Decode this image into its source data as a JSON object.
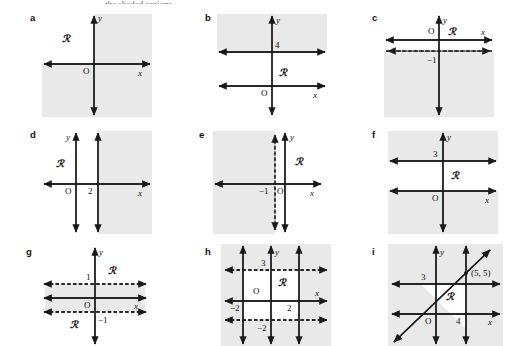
{
  "page": {
    "clipped_header": "the shaded regions.",
    "shade_color": "#e9e9e9",
    "line_color": "#1a1a1a",
    "background": "#ffffff",
    "region_symbol": "ℛ"
  },
  "panels": [
    {
      "key": "a",
      "label": "a",
      "description": "Axes only; unshaded region is the second quadrant.",
      "region_label": "ℛ",
      "axis_labels": {
        "x": "x",
        "y": "y",
        "origin": "O"
      },
      "tick_labels": [],
      "lines": []
    },
    {
      "key": "b",
      "label": "b",
      "description": "Solid horizontal line y = 4; shading above it; region below.",
      "region_label": "ℛ",
      "axis_labels": {
        "x": "x",
        "y": "y",
        "origin": "O"
      },
      "tick_labels": [
        "4"
      ],
      "lines": [
        {
          "type": "horizontal",
          "value": "4",
          "style": "solid"
        }
      ]
    },
    {
      "key": "c",
      "label": "c",
      "description": "Dashed horizontal line y = -1; shading below it; region above.",
      "region_label": "ℛ",
      "axis_labels": {
        "x": "x",
        "y": "y",
        "origin": "O"
      },
      "tick_labels": [
        "−1"
      ],
      "lines": [
        {
          "type": "horizontal",
          "value": "-1",
          "style": "dashed"
        }
      ]
    },
    {
      "key": "d",
      "label": "d",
      "description": "Solid vertical line x = 2; shading to the right; region to the left.",
      "region_label": "ℛ",
      "axis_labels": {
        "x": "x",
        "y": "y",
        "origin": "O"
      },
      "tick_labels": [
        "2"
      ],
      "lines": [
        {
          "type": "vertical",
          "value": "2",
          "style": "solid"
        }
      ]
    },
    {
      "key": "e",
      "label": "e",
      "description": "Dashed vertical line x = -1; shading to the left; region to the right.",
      "region_label": "ℛ",
      "axis_labels": {
        "x": "x",
        "y": "y",
        "origin": "O"
      },
      "tick_labels": [
        "−1"
      ],
      "lines": [
        {
          "type": "vertical",
          "value": "-1",
          "style": "dashed"
        }
      ]
    },
    {
      "key": "f",
      "label": "f",
      "description": "Solid horizontal line y = 3; shading above y = 3 and below y = 0; region is the strip between.",
      "region_label": "ℛ",
      "axis_labels": {
        "x": "x",
        "y": "y",
        "origin": "O"
      },
      "tick_labels": [
        "3"
      ],
      "lines": [
        {
          "type": "horizontal",
          "value": "3",
          "style": "solid"
        }
      ]
    },
    {
      "key": "g",
      "label": "g",
      "description": "Dashed horizontal lines y = 1 and y = -1; shading is the strip between them; regions above and below.",
      "region_label": "ℛ",
      "region_label_2": "ℛ",
      "axis_labels": {
        "x": "x",
        "y": "y",
        "origin": "O"
      },
      "tick_labels": [
        "1",
        "−1"
      ],
      "lines": [
        {
          "type": "horizontal",
          "value": "1",
          "style": "dashed"
        },
        {
          "type": "horizontal",
          "value": "-1",
          "style": "dashed"
        }
      ]
    },
    {
      "key": "h",
      "label": "h",
      "description": "Solid vertical lines x = -2 and x = 2; dashed horizontal lines y = 3 and y = -2; region is the unshaded rectangle.",
      "region_label": "ℛ",
      "axis_labels": {
        "x": "x",
        "y": "y",
        "origin": "O"
      },
      "tick_labels": [
        "3",
        "−2",
        "2",
        "−2"
      ],
      "lines": [
        {
          "type": "vertical",
          "value": "-2",
          "style": "solid"
        },
        {
          "type": "vertical",
          "value": "2",
          "style": "solid"
        },
        {
          "type": "horizontal",
          "value": "3",
          "style": "dashed"
        },
        {
          "type": "horizontal",
          "value": "-2",
          "style": "dashed"
        }
      ]
    },
    {
      "key": "i",
      "label": "i",
      "description": "Line y = x through (5,5); solid horizontal line y = 3; solid vertical line x = 4; region is the unshaded triangle.",
      "region_label": "ℛ",
      "axis_labels": {
        "x": "x",
        "y": "y",
        "origin": "O"
      },
      "tick_labels": [
        "3",
        "4"
      ],
      "point_label": "(5, 5)",
      "lines": [
        {
          "type": "horizontal",
          "value": "3",
          "style": "solid"
        },
        {
          "type": "vertical",
          "value": "4",
          "style": "solid"
        },
        {
          "type": "diagonal",
          "value": "y = x",
          "style": "solid"
        }
      ]
    }
  ]
}
